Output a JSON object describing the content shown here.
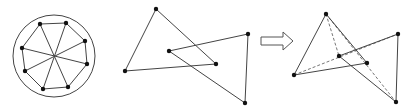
{
  "colors": {
    "line": "#444444",
    "point": "#111111",
    "dash": "#777777",
    "arrow": "#555555",
    "background": "#ffffff"
  },
  "figures": [
    {
      "name": "octagon-in-circle",
      "circle": {
        "cx": 54,
        "cy": 56,
        "r": 41
      },
      "center": [
        54,
        56
      ],
      "points": [
        [
          40,
          24
        ],
        [
          66,
          23
        ],
        [
          85,
          41
        ],
        [
          87,
          64
        ],
        [
          68,
          87
        ],
        [
          43,
          89
        ],
        [
          25,
          71
        ],
        [
          22,
          48
        ]
      ]
    },
    {
      "name": "two-triangles",
      "triangle_a": [
        [
          156,
          9
        ],
        [
          125,
          71
        ],
        [
          216,
          64
        ]
      ],
      "triangle_b": [
        [
          169,
          51
        ],
        [
          248,
          34
        ],
        [
          245,
          103
        ]
      ]
    },
    {
      "name": "arrow",
      "direction": "right"
    },
    {
      "name": "two-triangles-with-dashed-links",
      "triangle_a": [
        [
          326,
          14
        ],
        [
          294,
          75
        ],
        [
          367,
          63
        ]
      ],
      "triangle_b": [
        [
          339,
          56
        ],
        [
          398,
          34
        ],
        [
          396,
          102
        ]
      ],
      "dashed": [
        [
          [
            326,
            14
          ],
          [
            339,
            56
          ]
        ],
        [
          [
            294,
            75
          ],
          [
            398,
            34
          ]
        ],
        [
          [
            326,
            14
          ],
          [
            396,
            102
          ]
        ]
      ]
    }
  ]
}
